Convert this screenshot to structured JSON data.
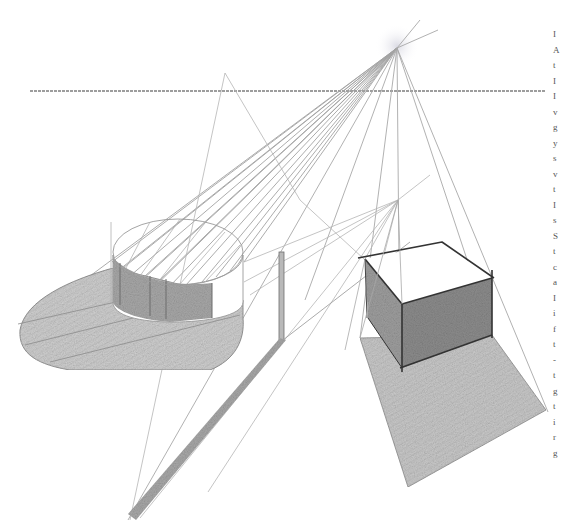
{
  "figure": {
    "colors": {
      "paper": "#ffffff",
      "construction_line": "#9a9a9a",
      "horizon_line": "#7d7d7d",
      "edge_dark": "#3a3a3a",
      "shade_dark": "#8c8c8c",
      "shade_mid": "#b8b8b8",
      "shade_light": "#d6d6d6",
      "light_glow": "#e4e4ea"
    },
    "horizon": {
      "y": 91,
      "x1": 30,
      "x2": 545
    },
    "vanishing_point": {
      "x": 397,
      "y": 48
    },
    "secondary_point": {
      "x": 398,
      "y": 200
    },
    "cylinder": {
      "cx": 173,
      "cy": 255,
      "rx": 64,
      "ry": 30,
      "bottom_y": 318
    },
    "cube": {
      "top": [
        [
          365,
          259
        ],
        [
          442,
          243
        ],
        [
          492,
          278
        ],
        [
          402,
          304
        ]
      ],
      "front": [
        [
          402,
          304
        ],
        [
          492,
          278
        ],
        [
          492,
          335
        ],
        [
          402,
          368
        ]
      ],
      "left": [
        [
          365,
          259
        ],
        [
          402,
          304
        ],
        [
          402,
          368
        ],
        [
          368,
          318
        ]
      ]
    },
    "cube_shadow": [
      [
        360,
        338
      ],
      [
        492,
        335
      ],
      [
        546,
        410
      ],
      [
        408,
        487
      ]
    ],
    "pole": {
      "x": 281,
      "y1": 252,
      "y2": 340
    }
  },
  "text_edge": {
    "glyphs": [
      "I",
      "A",
      "t",
      "I",
      "I",
      "v",
      "g",
      "y",
      "s",
      "v",
      "t",
      "I",
      "s",
      "S",
      "t",
      "c",
      "a",
      "I",
      "i",
      "f",
      "t",
      "-",
      "t",
      "g",
      "t",
      "i",
      "r",
      "g"
    ]
  }
}
